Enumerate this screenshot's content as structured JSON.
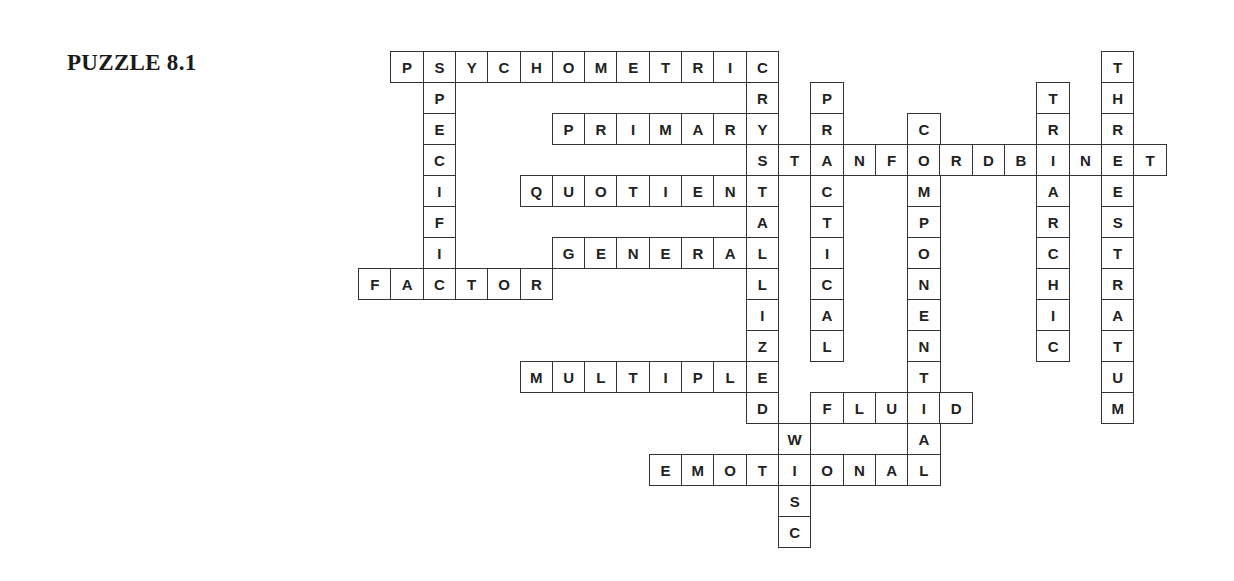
{
  "title": "PUZZLE 8.1",
  "grid": {
    "origin_x": 358,
    "origin_y": 51,
    "cell_w": 32.3,
    "cell_h": 31
  },
  "words": [
    {
      "word": "PSYCHOMETRIC",
      "dir": "across",
      "row": 0,
      "col": 1
    },
    {
      "word": "SPECIFIC",
      "dir": "down",
      "row": 0,
      "col": 2
    },
    {
      "word": "CRYSTALLIZED",
      "dir": "down",
      "row": 0,
      "col": 12
    },
    {
      "word": "PRIMARY",
      "dir": "across",
      "row": 2,
      "col": 6
    },
    {
      "word": "STANFORDBINET",
      "dir": "across",
      "row": 3,
      "col": 12
    },
    {
      "word": "QUOTIENT",
      "dir": "across",
      "row": 4,
      "col": 5
    },
    {
      "word": "GENERAL",
      "dir": "across",
      "row": 6,
      "col": 6
    },
    {
      "word": "FACTOR",
      "dir": "across",
      "row": 7,
      "col": 0
    },
    {
      "word": "PRACTICAL",
      "dir": "down",
      "row": 1,
      "col": 14
    },
    {
      "word": "COMPONENTIAL",
      "dir": "down",
      "row": 2,
      "col": 17
    },
    {
      "word": "TRIARCHIC",
      "dir": "down",
      "row": 1,
      "col": 21
    },
    {
      "word": "THREESTRATUM",
      "dir": "down",
      "row": 0,
      "col": 23
    },
    {
      "word": "MULTIPLE",
      "dir": "across",
      "row": 10,
      "col": 5
    },
    {
      "word": "FLUID",
      "dir": "across",
      "row": 11,
      "col": 14
    },
    {
      "word": "WISC",
      "dir": "down",
      "row": 12,
      "col": 13
    },
    {
      "word": "EMOTIONAL",
      "dir": "across",
      "row": 13,
      "col": 9
    }
  ]
}
